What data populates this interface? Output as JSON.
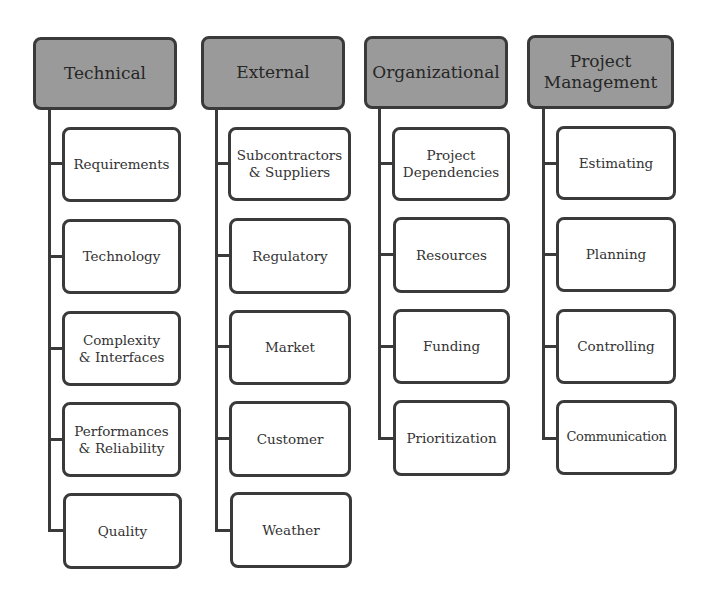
{
  "diagram": {
    "type": "risk-breakdown-structure",
    "colors": {
      "header_fill": "#9a9a9a",
      "border": "#3a3a3a",
      "child_fill": "#ffffff"
    },
    "categories": [
      {
        "label": "Technical",
        "children": [
          "Requirements",
          "Technology",
          "Complexity & Interfaces",
          "Performances & Reliability",
          "Quality"
        ]
      },
      {
        "label": "External",
        "children": [
          "Subcontractors & Suppliers",
          "Regulatory",
          "Market",
          "Customer",
          "Weather"
        ]
      },
      {
        "label": "Organizational",
        "children": [
          "Project Dependencies",
          "Resources",
          "Funding",
          "Prioritization"
        ]
      },
      {
        "label": "Project Management",
        "children": [
          "Estimating",
          "Planning",
          "Controlling",
          "Communication"
        ]
      }
    ]
  }
}
